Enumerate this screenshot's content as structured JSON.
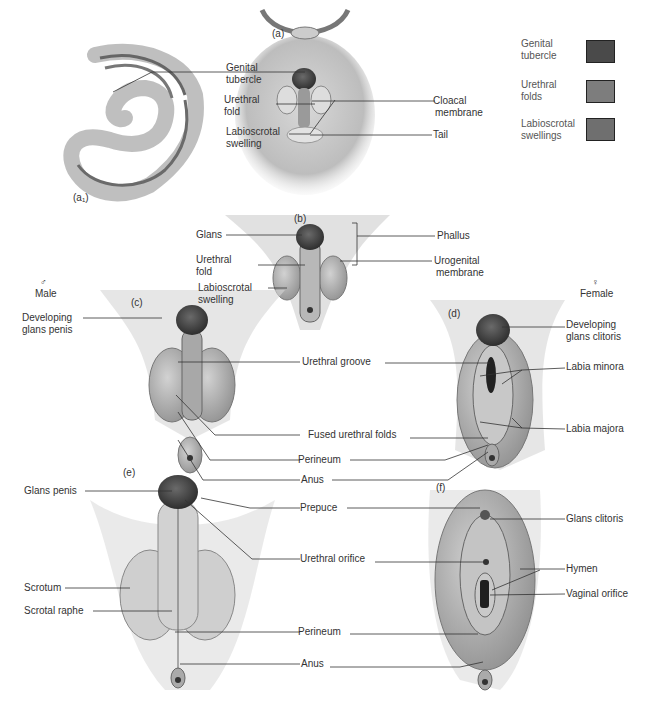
{
  "figure": {
    "panels": [
      {
        "id": "a1",
        "tag": "(a₁)"
      },
      {
        "id": "a",
        "tag": "(a)"
      },
      {
        "id": "b",
        "tag": "(b)"
      },
      {
        "id": "c",
        "tag": "(c)"
      },
      {
        "id": "d",
        "tag": "(d)"
      },
      {
        "id": "e",
        "tag": "(e)"
      },
      {
        "id": "f",
        "tag": "(f)"
      }
    ],
    "sex_labels": {
      "male_symbol": "♂",
      "male": "Male",
      "female_symbol": "♀",
      "female": "Female"
    },
    "legend": [
      {
        "line1": "Genital",
        "line2": "tubercle",
        "color": "#4a4a4a"
      },
      {
        "line1": "Urethral",
        "line2": "folds",
        "color": "#7d7d7d"
      },
      {
        "line1": "Labioscrotal",
        "line2": "swellings",
        "color": "#6f6f6f"
      }
    ],
    "labels_a": {
      "genital_tubercle_1": "Genital",
      "genital_tubercle_2": "tubercle",
      "urethral_fold_1": "Urethral",
      "urethral_fold_2": "fold",
      "labioscrotal_swelling_1": "Labioscrotal",
      "labioscrotal_swelling_2": "swelling",
      "cloacal_membrane_1": "Cloacal",
      "cloacal_membrane_2": "membrane",
      "tail": "Tail"
    },
    "labels_b": {
      "glans": "Glans",
      "urethral_fold_1": "Urethral",
      "urethral_fold_2": "fold",
      "labioscrotal_swelling_1": "Labioscrotal",
      "labioscrotal_swelling_2": "swelling",
      "phallus": "Phallus",
      "urogenital_membrane_1": "Urogenital",
      "urogenital_membrane_2": "membrane"
    },
    "labels_cd": {
      "developing_glans_penis_1": "Developing",
      "developing_glans_penis_2": "glans penis",
      "developing_glans_clitoris_1": "Developing",
      "developing_glans_clitoris_2": "glans clitoris",
      "urethral_groove": "Urethral groove",
      "labia_minora": "Labia minora",
      "fused_urethral_folds": "Fused urethral folds",
      "labia_majora": "Labia majora",
      "perineum": "Perineum",
      "anus": "Anus"
    },
    "labels_ef": {
      "glans_penis": "Glans penis",
      "prepuce": "Prepuce",
      "glans_clitoris": "Glans clitoris",
      "urethral_orifice": "Urethral orifice",
      "hymen": "Hymen",
      "vaginal_orifice": "Vaginal orifice",
      "scrotum": "Scrotum",
      "scrotal_raphe": "Scrotal raphe",
      "perineum": "Perineum",
      "anus": "Anus"
    }
  }
}
